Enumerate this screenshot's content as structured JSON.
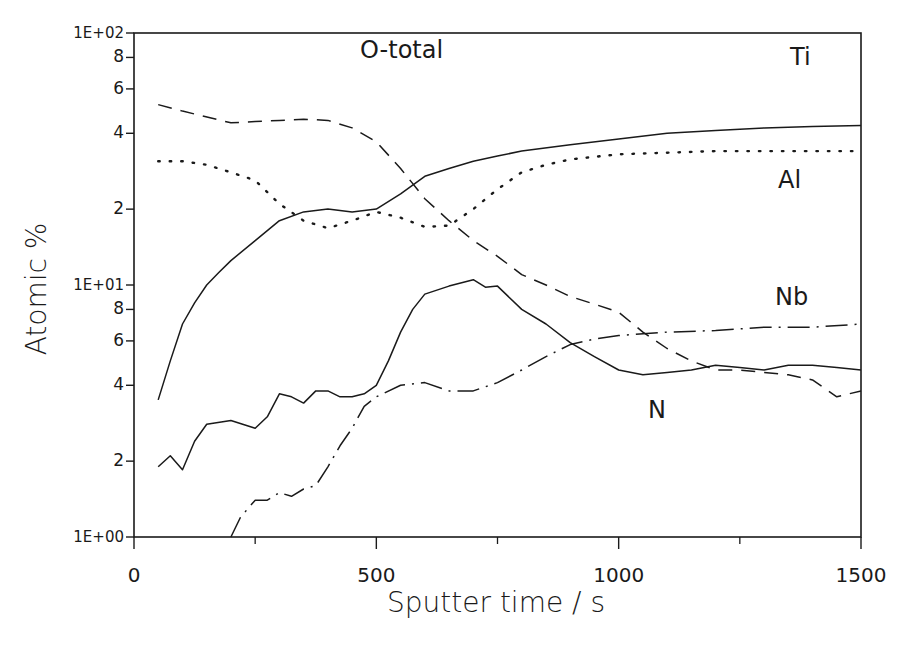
{
  "chart_data": {
    "type": "line",
    "title": "",
    "xlabel": "Sputter time / s",
    "ylabel": "Atomic %",
    "xscale": "linear",
    "yscale": "log",
    "xlim": [
      0,
      1500
    ],
    "ylim": [
      1,
      100
    ],
    "grid": false,
    "legend": "inline labels",
    "x_ticks": [
      0,
      500,
      1000,
      1500
    ],
    "x_tick_labels": [
      "0",
      "500",
      "1000",
      "1500"
    ],
    "x_minor_ticks": [
      250,
      750,
      1250
    ],
    "y_ticks": [
      1,
      2,
      4,
      6,
      8,
      10,
      20,
      40,
      60,
      80,
      100
    ],
    "y_tick_labels": [
      "1E+00",
      "2",
      "4",
      "6",
      "8",
      "1E+01",
      "2",
      "4",
      "6",
      "8",
      "1E+02"
    ],
    "series": [
      {
        "name": "O-total",
        "style": "dashed",
        "label_pos": [
          360,
          58
        ],
        "points": [
          [
            50,
            52
          ],
          [
            100,
            49
          ],
          [
            200,
            44
          ],
          [
            250,
            44.5
          ],
          [
            300,
            45
          ],
          [
            350,
            45.5
          ],
          [
            400,
            45
          ],
          [
            450,
            42
          ],
          [
            500,
            37
          ],
          [
            550,
            29
          ],
          [
            600,
            22
          ],
          [
            650,
            18
          ],
          [
            700,
            15
          ],
          [
            750,
            13
          ],
          [
            800,
            11
          ],
          [
            850,
            10
          ],
          [
            900,
            9
          ],
          [
            950,
            8.4
          ],
          [
            1000,
            7.8
          ],
          [
            1050,
            6.5
          ],
          [
            1100,
            5.6
          ],
          [
            1150,
            5
          ],
          [
            1200,
            4.6
          ],
          [
            1250,
            4.6
          ],
          [
            1300,
            4.5
          ],
          [
            1350,
            4.4
          ],
          [
            1400,
            4.2
          ],
          [
            1450,
            3.6
          ],
          [
            1500,
            3.8
          ]
        ]
      },
      {
        "name": "Ti",
        "style": "solid",
        "label_pos": [
          790,
          65
        ],
        "points": [
          [
            50,
            3.5
          ],
          [
            75,
            5
          ],
          [
            100,
            7
          ],
          [
            125,
            8.5
          ],
          [
            150,
            10
          ],
          [
            175,
            11.2
          ],
          [
            200,
            12.5
          ],
          [
            250,
            15
          ],
          [
            300,
            18
          ],
          [
            350,
            19.5
          ],
          [
            400,
            20
          ],
          [
            450,
            19.5
          ],
          [
            500,
            20
          ],
          [
            550,
            23
          ],
          [
            600,
            27
          ],
          [
            650,
            29
          ],
          [
            700,
            31
          ],
          [
            750,
            32.5
          ],
          [
            800,
            34
          ],
          [
            900,
            36
          ],
          [
            1000,
            38
          ],
          [
            1100,
            40
          ],
          [
            1200,
            41
          ],
          [
            1300,
            42
          ],
          [
            1400,
            42.5
          ],
          [
            1500,
            43
          ]
        ]
      },
      {
        "name": "Al",
        "style": "dotted",
        "label_pos": [
          778,
          188
        ],
        "points": [
          [
            50,
            31
          ],
          [
            100,
            31
          ],
          [
            150,
            30
          ],
          [
            200,
            28
          ],
          [
            250,
            26
          ],
          [
            300,
            21
          ],
          [
            350,
            18
          ],
          [
            400,
            16.8
          ],
          [
            450,
            18
          ],
          [
            500,
            19.5
          ],
          [
            550,
            18.5
          ],
          [
            600,
            17
          ],
          [
            650,
            17.2
          ],
          [
            700,
            20
          ],
          [
            750,
            24
          ],
          [
            800,
            28
          ],
          [
            850,
            30
          ],
          [
            900,
            31.5
          ],
          [
            1000,
            33
          ],
          [
            1100,
            33.5
          ],
          [
            1200,
            34
          ],
          [
            1300,
            34
          ],
          [
            1500,
            34
          ]
        ]
      },
      {
        "name": "N",
        "style": "solid",
        "label_pos": [
          648,
          418
        ],
        "points": [
          [
            50,
            1.9
          ],
          [
            75,
            2.1
          ],
          [
            100,
            1.85
          ],
          [
            125,
            2.4
          ],
          [
            150,
            2.8
          ],
          [
            200,
            2.9
          ],
          [
            250,
            2.7
          ],
          [
            275,
            3
          ],
          [
            300,
            3.7
          ],
          [
            325,
            3.6
          ],
          [
            350,
            3.4
          ],
          [
            375,
            3.8
          ],
          [
            400,
            3.8
          ],
          [
            425,
            3.6
          ],
          [
            450,
            3.6
          ],
          [
            475,
            3.7
          ],
          [
            500,
            4
          ],
          [
            525,
            5
          ],
          [
            550,
            6.5
          ],
          [
            575,
            8
          ],
          [
            600,
            9.2
          ],
          [
            650,
            9.9
          ],
          [
            700,
            10.5
          ],
          [
            725,
            9.8
          ],
          [
            750,
            9.9
          ],
          [
            800,
            8
          ],
          [
            850,
            7
          ],
          [
            900,
            5.9
          ],
          [
            950,
            5.2
          ],
          [
            1000,
            4.6
          ],
          [
            1050,
            4.4
          ],
          [
            1100,
            4.5
          ],
          [
            1150,
            4.6
          ],
          [
            1200,
            4.8
          ],
          [
            1250,
            4.7
          ],
          [
            1300,
            4.6
          ],
          [
            1350,
            4.8
          ],
          [
            1400,
            4.8
          ],
          [
            1450,
            4.7
          ],
          [
            1500,
            4.6
          ]
        ]
      },
      {
        "name": "Nb",
        "style": "dash-dot",
        "label_pos": [
          775,
          305
        ],
        "points": [
          [
            200,
            1
          ],
          [
            220,
            1.2
          ],
          [
            250,
            1.4
          ],
          [
            275,
            1.4
          ],
          [
            300,
            1.5
          ],
          [
            325,
            1.45
          ],
          [
            350,
            1.55
          ],
          [
            375,
            1.6
          ],
          [
            400,
            1.9
          ],
          [
            425,
            2.3
          ],
          [
            450,
            2.7
          ],
          [
            475,
            3.3
          ],
          [
            500,
            3.6
          ],
          [
            550,
            4
          ],
          [
            600,
            4.1
          ],
          [
            650,
            3.8
          ],
          [
            700,
            3.8
          ],
          [
            750,
            4.1
          ],
          [
            800,
            4.6
          ],
          [
            850,
            5.2
          ],
          [
            900,
            5.8
          ],
          [
            950,
            6.1
          ],
          [
            1000,
            6.3
          ],
          [
            1100,
            6.5
          ],
          [
            1200,
            6.6
          ],
          [
            1300,
            6.8
          ],
          [
            1400,
            6.8
          ],
          [
            1500,
            7
          ]
        ]
      }
    ]
  },
  "axes": {
    "x_title": "Sputter time / s",
    "y_title": "Atomic %"
  }
}
